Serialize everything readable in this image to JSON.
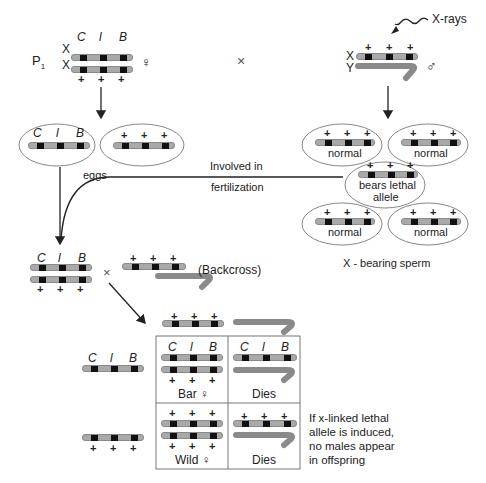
{
  "colors": {
    "chromosome": "#a9a9a9",
    "band": "#111111",
    "line": "#222222",
    "ellipse_stroke": "#888888"
  },
  "parental": {
    "generation_label": "P",
    "generation_sub": "1",
    "female": {
      "chrom_labels": [
        "X",
        "X"
      ],
      "alleles_top": [
        "C",
        "l",
        "B"
      ],
      "alleles_bottom": [
        "+",
        "+",
        "+"
      ],
      "sex_symbol": "♀"
    },
    "cross_symbol": "×",
    "male": {
      "chrom_labels": [
        "X",
        "Y"
      ],
      "alleles_top": [
        "+",
        "+",
        "+"
      ],
      "sex_symbol": "♂",
      "xray_label": "X-rays"
    }
  },
  "eggs": {
    "label": "eggs",
    "egg1_alleles": [
      "C",
      "l",
      "B"
    ],
    "egg2_alleles": [
      "+",
      "+",
      "+"
    ]
  },
  "sperm": {
    "label": "X - bearing sperm",
    "alleles": [
      "+",
      "+",
      "+"
    ],
    "items": [
      {
        "label": "normal"
      },
      {
        "label": "normal"
      },
      {
        "label_line1": "bears lethal",
        "label_line2": "allele"
      },
      {
        "label": "normal"
      },
      {
        "label": "normal"
      }
    ]
  },
  "fertilization": {
    "label_line1": "Involved in",
    "label_line2": "fertilization"
  },
  "backcross": {
    "label": "(Backcross)",
    "cross_symbol": "×",
    "female_alleles_top": [
      "C",
      "l",
      "B"
    ],
    "female_alleles_bottom": [
      "+",
      "+",
      "+"
    ],
    "male_alleles_top": [
      "+",
      "+",
      "+"
    ]
  },
  "offspring": {
    "row_labels": {
      "row1_alleles": [
        "C",
        "l",
        "B"
      ],
      "row2_alleles": [
        "+",
        "+",
        "+"
      ]
    },
    "column_header_alleles": [
      "+",
      "+",
      "+"
    ],
    "cells": [
      {
        "label": "Bar ♀",
        "top": [
          "C",
          "l",
          "B"
        ],
        "bottom": [
          "+",
          "+",
          "+"
        ]
      },
      {
        "label": "Dies",
        "top": [
          "C",
          "l",
          "B"
        ]
      },
      {
        "label": "Wild ♀",
        "top": [
          "+",
          "+",
          "+"
        ],
        "bottom": [
          "+",
          "+",
          "+"
        ]
      },
      {
        "label": "Dies",
        "top": [
          "+",
          "+",
          "+"
        ]
      }
    ],
    "note_lines": [
      "If x-linked lethal",
      "allele is induced,",
      "no males appear",
      "in offspring"
    ]
  }
}
